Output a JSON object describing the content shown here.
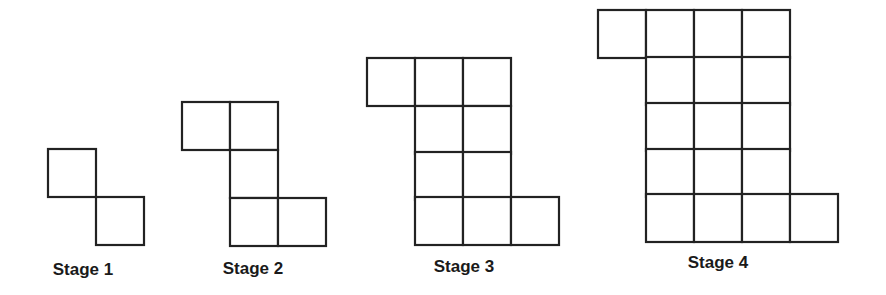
{
  "figure": {
    "cell_size": 48,
    "line_color": "#222222",
    "stages": [
      {
        "label": "Stage 1",
        "n": 1,
        "total_squares": 2,
        "label_pos": [
          83,
          275
        ],
        "cells": [
          [
            48,
            149
          ],
          [
            96,
            197
          ]
        ]
      },
      {
        "label": "Stage 2",
        "n": 2,
        "total_squares": 5,
        "label_pos": [
          253,
          274
        ],
        "cells": [
          [
            182,
            102
          ],
          [
            230,
            102
          ],
          [
            230,
            150
          ],
          [
            230,
            198
          ],
          [
            278,
            198
          ]
        ]
      },
      {
        "label": "Stage 3",
        "n": 3,
        "total_squares": 10,
        "label_pos": [
          464,
          272
        ],
        "cells": [
          [
            367,
            58
          ],
          [
            415,
            58
          ],
          [
            463,
            58
          ],
          [
            415,
            106
          ],
          [
            463,
            106
          ],
          [
            415,
            152
          ],
          [
            463,
            152
          ],
          [
            415,
            197
          ],
          [
            463,
            197
          ],
          [
            511,
            197
          ]
        ]
      },
      {
        "label": "Stage 4",
        "n": 4,
        "total_squares": 17,
        "label_pos": [
          718,
          268
        ],
        "cells": [
          [
            598,
            10
          ],
          [
            646,
            10
          ],
          [
            694,
            10
          ],
          [
            742,
            10
          ],
          [
            646,
            57
          ],
          [
            694,
            57
          ],
          [
            742,
            57
          ],
          [
            646,
            103
          ],
          [
            694,
            103
          ],
          [
            742,
            103
          ],
          [
            646,
            149
          ],
          [
            694,
            149
          ],
          [
            742,
            149
          ],
          [
            646,
            194
          ],
          [
            694,
            194
          ],
          [
            742,
            194
          ],
          [
            790,
            194
          ]
        ]
      }
    ]
  }
}
